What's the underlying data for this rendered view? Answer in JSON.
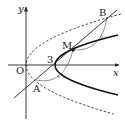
{
  "diagram": {
    "type": "coordinate-geometry",
    "axis_labels": {
      "x": "x",
      "y": "y"
    },
    "origin_label": "O",
    "x_intercept_label": "3",
    "points": [
      {
        "id": "A",
        "label": "A"
      },
      {
        "id": "B",
        "label": "B"
      },
      {
        "id": "M",
        "label": "M"
      }
    ],
    "curves": [
      {
        "id": "solid-parabola",
        "style": "solid",
        "vertex": [
          3,
          0
        ],
        "opens": "right"
      },
      {
        "id": "dashed-parabola",
        "style": "dashed",
        "vertex": [
          0,
          0
        ],
        "opens": "right"
      }
    ],
    "line": {
      "through": [
        "A",
        "B"
      ],
      "passes_x_axis_at": 3
    },
    "equal_segment_marks": [
      "AM",
      "MB"
    ]
  }
}
